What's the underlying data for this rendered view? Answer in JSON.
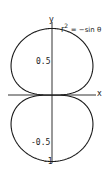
{
  "chart_data": {
    "type": "line",
    "subtype": "polar-curve",
    "title": "",
    "equation_label": "r² = −sin θ",
    "xlabel": "x",
    "ylabel": "y",
    "y_ticks": [
      {
        "value": 0.5,
        "label": "0.5"
      },
      {
        "value": -0.5,
        "label": "-0.5"
      },
      {
        "value": -1,
        "label": "-1"
      }
    ],
    "ylim": [
      -1,
      1
    ],
    "xlim": [
      -0.75,
      0.75
    ],
    "grid": false,
    "legend": "none",
    "series": [
      {
        "name": "r² = −sin θ",
        "description": "two-lobed curve symmetric about both axes, tangent to x-axis at origin, reaching y=±1",
        "points_sample": [
          {
            "x": 0,
            "y": 1
          },
          {
            "x": 0.62,
            "y": 0.58
          },
          {
            "x": 0,
            "y": 0
          },
          {
            "x": -0.62,
            "y": 0.58
          },
          {
            "x": 0,
            "y": -1
          },
          {
            "x": 0.62,
            "y": -0.58
          },
          {
            "x": -0.62,
            "y": -0.58
          }
        ]
      }
    ]
  },
  "labels": {
    "x_axis": "x",
    "y_axis": "y",
    "equation_r": "r",
    "equation_exp": "2",
    "equation_rhs": "= −sin θ",
    "tick_pos_half": "0.5",
    "tick_neg_half": "-0.5",
    "tick_neg_one": "-1"
  },
  "colors": {
    "curve": "#1a1a1a",
    "axes": "#333333",
    "background": "#ffffff"
  }
}
